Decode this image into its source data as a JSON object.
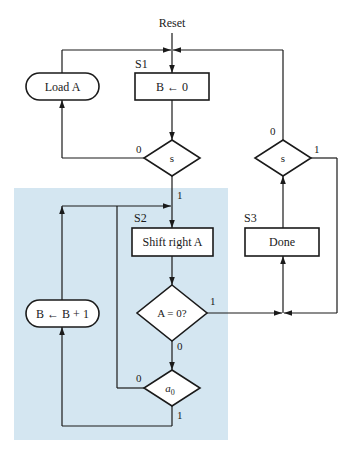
{
  "colors": {
    "stroke": "#1a1a1a",
    "shaded_region": "#d4e6f1",
    "box_fill": "#ffffff"
  },
  "start": {
    "label": "Reset"
  },
  "states": [
    {
      "id": "S1",
      "label": "S1"
    },
    {
      "id": "S2",
      "label": "S2"
    },
    {
      "id": "S3",
      "label": "S3"
    }
  ],
  "nodes": {
    "load_a": {
      "type": "conditional-output",
      "text": "Load A"
    },
    "s1_action": {
      "type": "state-box",
      "text": "B ← 0"
    },
    "s_decision_left": {
      "type": "decision",
      "text": "s",
      "out0": "0",
      "out1": "1"
    },
    "s2_action": {
      "type": "state-box",
      "text": "Shift right A"
    },
    "a_zero_decision": {
      "type": "decision",
      "text": "A = 0?",
      "out0": "0",
      "out1": "1"
    },
    "a0_decision": {
      "type": "decision",
      "text_main": "a",
      "text_sub": "0",
      "out0": "0",
      "out1": "1"
    },
    "b_increment": {
      "type": "conditional-output",
      "text": "B ← B + 1"
    },
    "s3_action": {
      "type": "state-box",
      "text": "Done"
    },
    "s_decision_right": {
      "type": "decision",
      "text": "s",
      "out0": "0",
      "out1": "1"
    }
  }
}
